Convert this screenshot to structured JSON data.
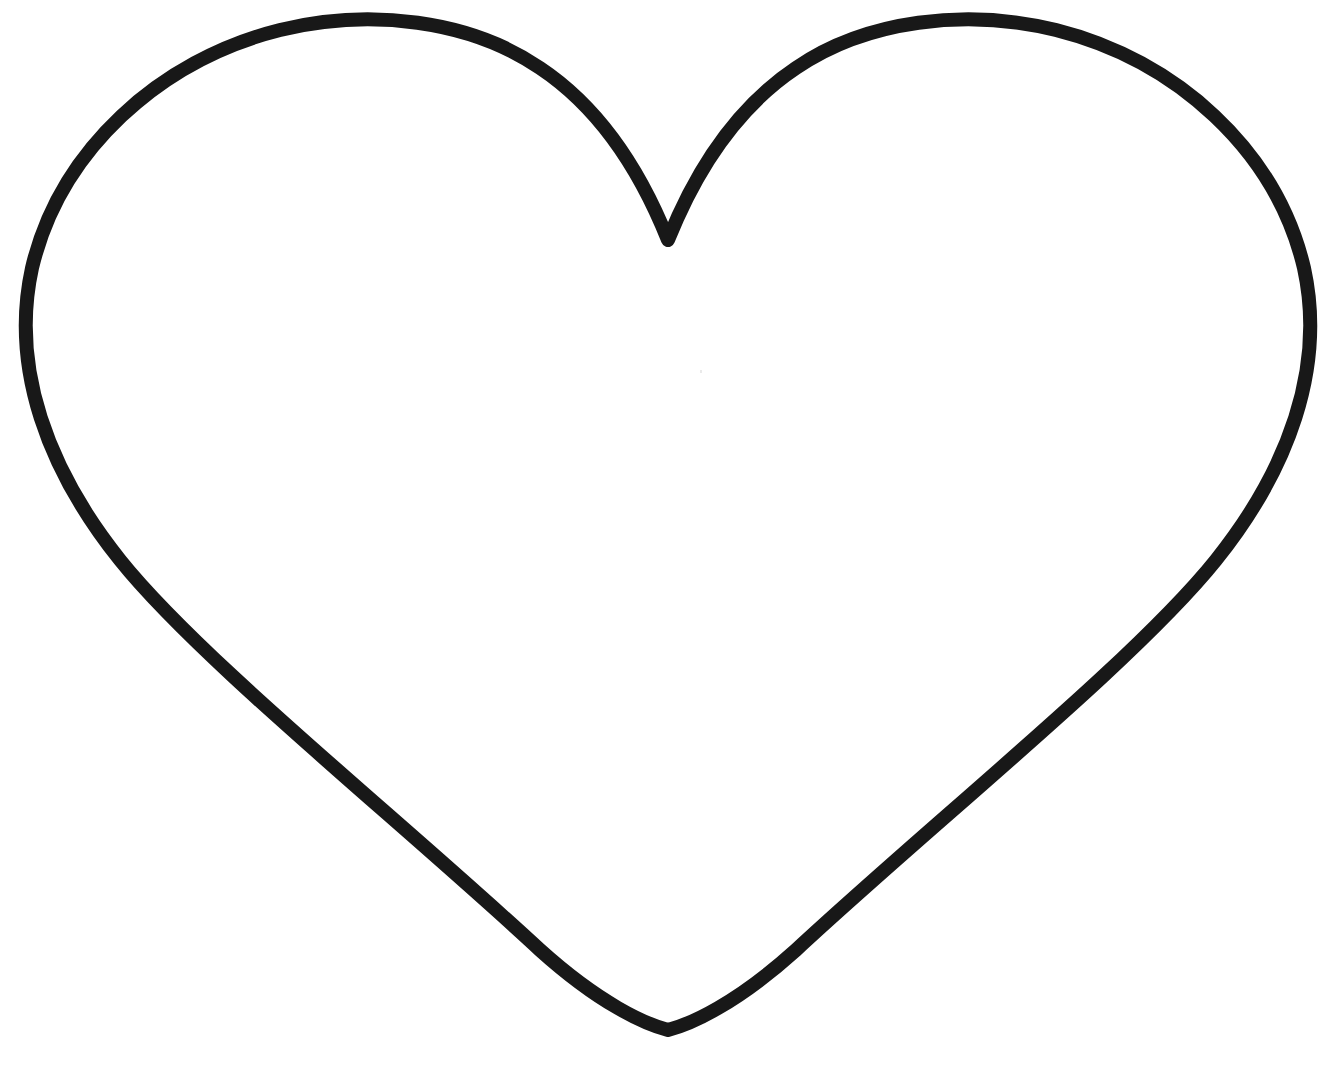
{
  "image": {
    "title": "Heart outline drawing",
    "subject": "heart",
    "style": "line art outline, uncolored",
    "width": 1322,
    "height": 1073,
    "background_color": "#FFFFFF",
    "stroke_color": "#181818",
    "stroke_width": 14,
    "fill": "none"
  },
  "shape": {
    "name": "heart",
    "description": "Symmetric heart silhouette drawn as a single closed black contour on a plain white field. Two broad rounded upper lobes meet at a sharp central cleft near the top, and the long outer flanks sweep down and inward to a narrow sharp point at the bottom.",
    "symmetry": "bilateral, vertical axis",
    "closed_path": true,
    "key_points": {
      "top_cleft_x": 670,
      "top_cleft_y": 240,
      "bottom_tip_x": 665,
      "bottom_tip_y": 1030,
      "leftmost_x": 25,
      "leftmost_y": 285,
      "rightmost_x": 1310,
      "rightmost_y": 272,
      "left_lobe_peak_x": 340,
      "left_lobe_peak_y": 26,
      "right_lobe_peak_x": 1000,
      "right_lobe_peak_y": 28,
      "vertical_axis_x": 668
    },
    "path_d": "M 668 240 C 640 170 600 108 540 68 C 470 20 370 8 280 30 C 160 60 60 150 32 268 C 10 368 48 470 120 560 C 200 660 400 820 540 950 C 600 1004 645 1024 668 1030 C 691 1024 736 1004 796 950 C 936 820 1136 660 1216 560 C 1288 470 1326 368 1304 268 C 1276 150 1176 60 1056 30 C 966 8 866 20 796 68 C 736 108 696 170 668 240 Z",
    "speck": {
      "x": 700,
      "y": 370,
      "note": "faint scanner speck inside the figure"
    }
  }
}
